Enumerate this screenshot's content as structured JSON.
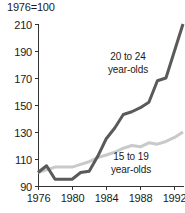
{
  "chart_data": {
    "type": "line",
    "title": "1976=100",
    "subtitle": "",
    "xlabel": "",
    "ylabel": "",
    "xlim": [
      1976,
      1993
    ],
    "ylim": [
      90,
      210
    ],
    "yticks": [
      90,
      110,
      130,
      150,
      170,
      190,
      210
    ],
    "xticks": [
      1976,
      1980,
      1984,
      1988,
      1992
    ],
    "ytick_labels": [
      "90",
      "110",
      "130",
      "150",
      "170",
      "190",
      "210"
    ],
    "xtick_labels": [
      "1976",
      "1980",
      "1984",
      "1988",
      "1992"
    ],
    "grid": false,
    "legend": "inline-annotations",
    "x": [
      1976,
      1977,
      1978,
      1979,
      1980,
      1981,
      1982,
      1983,
      1984,
      1985,
      1986,
      1987,
      1988,
      1989,
      1990,
      1991,
      1992,
      1993
    ],
    "series": [
      {
        "name": "20 to 24 year-olds",
        "label_line1": "20 to 24",
        "label_line2": "year-olds",
        "color": "#5a5a5a",
        "stroke_width": 3.0,
        "values": [
          100,
          105,
          95,
          95,
          95,
          100,
          101,
          112,
          125,
          133,
          143,
          145,
          148,
          152,
          168,
          170,
          190,
          210
        ]
      },
      {
        "name": "15 to 19 year-olds",
        "label_line1": "15 to 19",
        "label_line2": "year-olds",
        "color": "#c9c9c9",
        "stroke_width": 3.0,
        "values": [
          100,
          102,
          104,
          104,
          104,
          106,
          108,
          111,
          113,
          115,
          118,
          120,
          119,
          122,
          121,
          123,
          126,
          130
        ]
      }
    ],
    "annotations": [
      {
        "text_line1": "20 to 24",
        "text_line2": "year-olds",
        "x_px": 128,
        "y_px": 60
      },
      {
        "text_line1": "15 to 19",
        "text_line2": "year-olds",
        "x_px": 131,
        "y_px": 160
      }
    ]
  },
  "axes_geometry": {
    "plot_left_px": 38,
    "plot_right_px": 183,
    "plot_top_px": 24,
    "plot_bottom_px": 186
  },
  "colors": {
    "background": "#ffffff",
    "axis": "#333333",
    "text": "#1a1a1a",
    "series_dark": "#5a5a5a",
    "series_light": "#c9c9c9"
  }
}
